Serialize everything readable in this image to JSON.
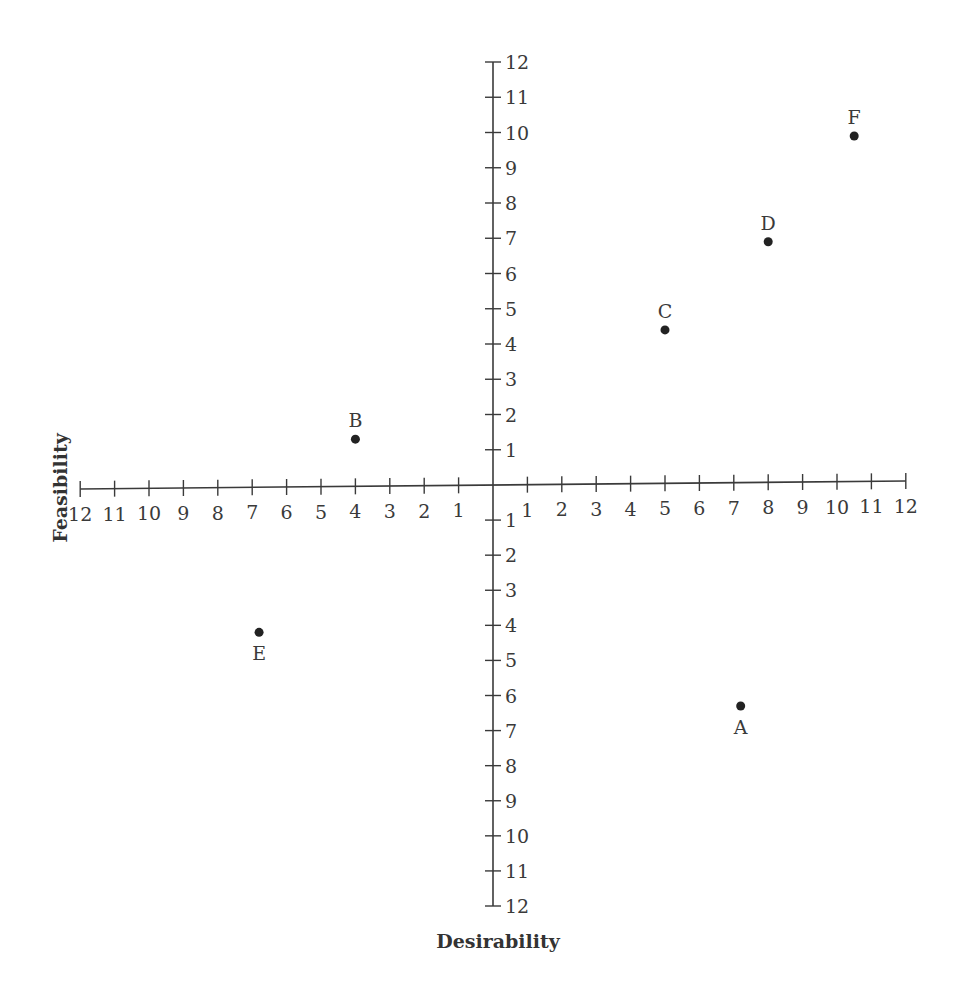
{
  "chart_data": {
    "type": "scatter",
    "title": "",
    "xlabel": "Desirability",
    "ylabel": "Feasibility",
    "xlim": [
      -12,
      12
    ],
    "ylim": [
      -12,
      12
    ],
    "grid": false,
    "legend": null,
    "x_ticks_left": [
      "12",
      "11",
      "10",
      "9",
      "8",
      "7",
      "6",
      "5",
      "4",
      "3",
      "2",
      "1"
    ],
    "x_ticks_right": [
      "1",
      "2",
      "3",
      "4",
      "5",
      "6",
      "7",
      "8",
      "9",
      "10",
      "11",
      "12"
    ],
    "y_ticks_top": [
      "12",
      "11",
      "10",
      "9",
      "8",
      "7",
      "6",
      "5",
      "4",
      "3",
      "2",
      "1"
    ],
    "y_ticks_bottom": [
      "1",
      "2",
      "3",
      "4",
      "5",
      "6",
      "7",
      "8",
      "9",
      "10",
      "11",
      "12"
    ],
    "points": [
      {
        "label": "A",
        "x": 7.2,
        "y": -6.3,
        "label_position": "below"
      },
      {
        "label": "B",
        "x": -4.0,
        "y": 1.3,
        "label_position": "above"
      },
      {
        "label": "C",
        "x": 5.0,
        "y": 4.4,
        "label_position": "above"
      },
      {
        "label": "D",
        "x": 8.0,
        "y": 6.9,
        "label_position": "above"
      },
      {
        "label": "E",
        "x": -6.8,
        "y": -4.2,
        "label_position": "below"
      },
      {
        "label": "F",
        "x": 10.5,
        "y": 9.9,
        "label_position": "above"
      }
    ],
    "colors": {
      "axis": "#3a3a3a",
      "point": "#222222",
      "text": "#3a3a3a"
    }
  }
}
